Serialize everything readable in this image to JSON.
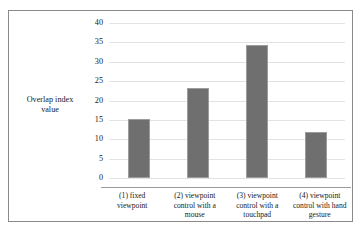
{
  "chart_data": {
    "type": "bar",
    "title": "",
    "xlabel": "",
    "ylabel": "Overlap index value",
    "ylabel_lines": [
      "Overlap index",
      "value"
    ],
    "categories": [
      "(1) fixed viewpoint",
      "(2) viewpoint control with a mouse",
      "(3) viewpoint control with a touchpad",
      "(4) viewpoint control with hand gesture"
    ],
    "category_lines": [
      [
        "(1) fixed",
        "viewpoint"
      ],
      [
        "(2) viewpoint",
        "control with a",
        "mouse"
      ],
      [
        "(3) viewpoint",
        "control with a",
        "touchpad"
      ],
      [
        "(4) viewpoint",
        "control with hand",
        "gesture"
      ]
    ],
    "values": [
      15.3,
      23.3,
      34.3,
      12.0
    ],
    "ylim": [
      0,
      40
    ],
    "ytick_labels": [
      "0",
      "5",
      "10",
      "15",
      "20",
      "25",
      "30",
      "35",
      "40"
    ],
    "ytick_values": [
      0,
      5,
      10,
      15,
      20,
      25,
      30,
      35,
      40
    ],
    "grid": true,
    "legend": "none",
    "bar_color": "#6f6f6f",
    "bar_edge_color": "#9c9c9c",
    "gridline_color": "#e3e3e3",
    "axis_color": "#9a9a9a",
    "frame_color": "#8a8a8a",
    "background": "#ffffff"
  }
}
